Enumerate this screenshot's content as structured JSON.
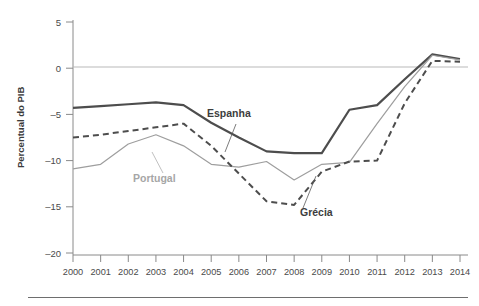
{
  "chart_data": {
    "type": "line",
    "title": "",
    "xlabel": "",
    "ylabel": "Percentual do PIB",
    "categories": [
      "2000",
      "2001",
      "2002",
      "2003",
      "2004",
      "2005",
      "2006",
      "2007",
      "2008",
      "2009",
      "2010",
      "2011",
      "2012",
      "2013",
      "2014"
    ],
    "x": [
      2000,
      2001,
      2002,
      2003,
      2004,
      2005,
      2006,
      2007,
      2008,
      2009,
      2010,
      2011,
      2012,
      2013,
      2014
    ],
    "ylim": [
      -20,
      5
    ],
    "xlim": [
      2000,
      2014
    ],
    "yticks": [
      5,
      0,
      -5,
      -10,
      -15,
      -20
    ],
    "ytick_labels": [
      "5",
      "0",
      "-5",
      "-10",
      "-15",
      "-20"
    ],
    "grid": false,
    "zero_line": true,
    "legend": "inline-annotations",
    "series": [
      {
        "name": "Espanha",
        "style": "solid",
        "color": "#4d4d4d",
        "width": 2.2,
        "values": [
          -4.3,
          -4.1,
          -3.9,
          -3.7,
          -4.0,
          -5.9,
          -7.5,
          -9.0,
          -9.2,
          -9.2,
          -4.5,
          -4.0,
          -1.2,
          1.5,
          1.0
        ]
      },
      {
        "name": "Portugal",
        "style": "solid",
        "color": "#9e9e9e",
        "width": 1.2,
        "values": [
          -10.9,
          -10.4,
          -8.2,
          -7.2,
          -8.4,
          -10.4,
          -10.7,
          -10.1,
          -12.1,
          -10.4,
          -10.2,
          -6.0,
          -2.0,
          1.4,
          0.9
        ]
      },
      {
        "name": "Grécia",
        "style": "dashed",
        "color": "#4d4d4d",
        "width": 2.0,
        "values": [
          -7.5,
          -7.2,
          -6.8,
          -6.4,
          -6.0,
          -8.4,
          -11.4,
          -14.4,
          -14.8,
          -11.2,
          -10.1,
          -10.0,
          -3.8,
          0.8,
          0.7
        ]
      }
    ],
    "annotations": [
      {
        "text": "Espanha",
        "color": "#3d3d3d",
        "x_px": 207,
        "y_px": 117
      },
      {
        "text": "Portugal",
        "color": "#a6a6a6",
        "x_px": 133,
        "y_px": 182
      },
      {
        "text": "Grécia",
        "color": "#3d3d3d",
        "x_px": 300,
        "y_px": 216
      }
    ]
  },
  "axis": {
    "y_title": "Percentual do PIB",
    "y_tick_0": "5",
    "y_tick_1": "0",
    "y_tick_2": "-5",
    "y_tick_3": "-10",
    "y_tick_4": "-15",
    "y_tick_5": "-20"
  },
  "colors": {
    "background": "#ffffff",
    "axis": "#8a8a8a",
    "zero_line": "#b5b5b5",
    "espanha": "#4d4d4d",
    "portugal": "#9e9e9e",
    "grecia": "#4d4d4d",
    "text": "#4a4a4a",
    "rule": "#6e6e6e"
  }
}
